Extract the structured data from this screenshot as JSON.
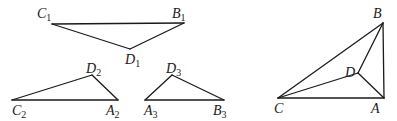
{
  "diagram": {
    "stroke_color": "#1a1a1a",
    "background": "#ffffff",
    "figures": [
      {
        "name": "triangle-1",
        "vertices": [
          {
            "id": "C1",
            "letter": "C",
            "sub": "1",
            "x": 52,
            "y": 24,
            "lx": 37,
            "ly": 18
          },
          {
            "id": "B1",
            "letter": "B",
            "sub": "1",
            "x": 184,
            "y": 23,
            "lx": 172,
            "ly": 18
          },
          {
            "id": "D1",
            "letter": "D",
            "sub": "1",
            "x": 130,
            "y": 49,
            "lx": 125,
            "ly": 64
          }
        ],
        "edges": [
          [
            "C1",
            "B1"
          ],
          [
            "B1",
            "D1"
          ],
          [
            "D1",
            "C1"
          ]
        ]
      },
      {
        "name": "triangle-2",
        "vertices": [
          {
            "id": "D2",
            "letter": "D",
            "sub": "2",
            "x": 92,
            "y": 75,
            "lx": 86,
            "ly": 73
          },
          {
            "id": "C2",
            "letter": "C",
            "sub": "2",
            "x": 12,
            "y": 100,
            "lx": 12,
            "ly": 115
          },
          {
            "id": "A2",
            "letter": "A",
            "sub": "2",
            "x": 118,
            "y": 100,
            "lx": 106,
            "ly": 115
          }
        ],
        "edges": [
          [
            "C2",
            "A2"
          ],
          [
            "A2",
            "D2"
          ],
          [
            "D2",
            "C2"
          ]
        ]
      },
      {
        "name": "triangle-3",
        "vertices": [
          {
            "id": "D3",
            "letter": "D",
            "sub": "3",
            "x": 172,
            "y": 75,
            "lx": 166,
            "ly": 73
          },
          {
            "id": "A3",
            "letter": "A",
            "sub": "3",
            "x": 145,
            "y": 100,
            "lx": 144,
            "ly": 115
          },
          {
            "id": "B3",
            "letter": "B",
            "sub": "3",
            "x": 224,
            "y": 100,
            "lx": 213,
            "ly": 115
          }
        ],
        "edges": [
          [
            "A3",
            "B3"
          ],
          [
            "B3",
            "D3"
          ],
          [
            "D3",
            "A3"
          ]
        ]
      },
      {
        "name": "quadrilateral-abcd",
        "vertices": [
          {
            "id": "B",
            "letter": "B",
            "sub": "",
            "x": 383,
            "y": 23,
            "lx": 373,
            "ly": 18
          },
          {
            "id": "D",
            "letter": "D",
            "sub": "",
            "x": 358,
            "y": 73,
            "lx": 345,
            "ly": 77
          },
          {
            "id": "C",
            "letter": "C",
            "sub": "",
            "x": 278,
            "y": 98,
            "lx": 274,
            "ly": 113
          },
          {
            "id": "A",
            "letter": "A",
            "sub": "",
            "x": 384,
            "y": 98,
            "lx": 371,
            "ly": 113
          }
        ],
        "edges": [
          [
            "C",
            "A"
          ],
          [
            "A",
            "B"
          ],
          [
            "B",
            "C"
          ],
          [
            "C",
            "D"
          ],
          [
            "D",
            "B"
          ],
          [
            "D",
            "A"
          ]
        ]
      }
    ]
  }
}
